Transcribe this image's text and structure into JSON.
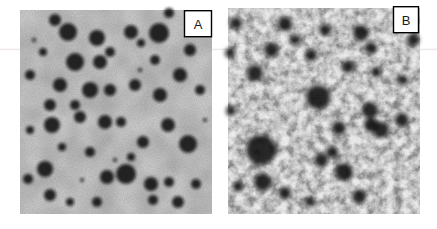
{
  "figure": {
    "panels": [
      {
        "label": "A",
        "droplets": [
          [
            35,
            10,
            6
          ],
          [
            48,
            22,
            9
          ],
          [
            77,
            28,
            8
          ],
          [
            90,
            42,
            5
          ],
          [
            23,
            42,
            4
          ],
          [
            55,
            52,
            9
          ],
          [
            80,
            52,
            7
          ],
          [
            10,
            65,
            5
          ],
          [
            40,
            75,
            7
          ],
          [
            70,
            80,
            8
          ],
          [
            90,
            80,
            6
          ],
          [
            30,
            95,
            6
          ],
          [
            55,
            95,
            5
          ],
          [
            111,
            22,
            7
          ],
          [
            139,
            23,
            10
          ],
          [
            121,
            33,
            4
          ],
          [
            149,
            3,
            5
          ],
          [
            170,
            40,
            6
          ],
          [
            135,
            50,
            5
          ],
          [
            160,
            65,
            7
          ],
          [
            115,
            75,
            6
          ],
          [
            140,
            85,
            7
          ],
          [
            180,
            80,
            5
          ],
          [
            32,
            115,
            8
          ],
          [
            10,
            120,
            4
          ],
          [
            60,
            107,
            6
          ],
          [
            85,
            112,
            7
          ],
          [
            42,
            137,
            4
          ],
          [
            70,
            142,
            5
          ],
          [
            25,
            159,
            8
          ],
          [
            8,
            169,
            5
          ],
          [
            87,
            167,
            7
          ],
          [
            30,
            185,
            6
          ],
          [
            50,
            192,
            4
          ],
          [
            77,
            192,
            5
          ],
          [
            148,
            115,
            7
          ],
          [
            123,
            132,
            6
          ],
          [
            168,
            134,
            9
          ],
          [
            111,
            147,
            4
          ],
          [
            106,
            164,
            10
          ],
          [
            131,
            174,
            7
          ],
          [
            149,
            172,
            5
          ],
          [
            176,
            174,
            5
          ],
          [
            133,
            190,
            5
          ],
          [
            158,
            192,
            6
          ],
          [
            101,
            112,
            5
          ],
          [
            14,
            30,
            2
          ],
          [
            120,
            60,
            2
          ],
          [
            95,
            150,
            2
          ],
          [
            62,
            170,
            2
          ],
          [
            185,
            110,
            2
          ]
        ]
      },
      {
        "label": "B",
        "droplets": [
          [
            57,
            16,
            7
          ],
          [
            97,
            22,
            6
          ],
          [
            133,
            25,
            8
          ],
          [
            185,
            32,
            6
          ],
          [
            43,
            42,
            7
          ],
          [
            27,
            65,
            8
          ],
          [
            120,
            59,
            6
          ],
          [
            148,
            64,
            5
          ],
          [
            90,
            89,
            12
          ],
          [
            142,
            102,
            8
          ],
          [
            153,
            122,
            8
          ],
          [
            33,
            142,
            15
          ],
          [
            93,
            152,
            7
          ],
          [
            35,
            174,
            9
          ],
          [
            116,
            164,
            9
          ],
          [
            174,
            112,
            7
          ],
          [
            67,
            32,
            5
          ],
          [
            8,
            15,
            6
          ],
          [
            2,
            45,
            5
          ],
          [
            83,
            47,
            6
          ],
          [
            143,
            40,
            6
          ],
          [
            111,
            120,
            7
          ],
          [
            143,
            117,
            7
          ],
          [
            104,
            144,
            6
          ],
          [
            131,
            189,
            7
          ],
          [
            10,
            179,
            5
          ],
          [
            57,
            185,
            6
          ],
          [
            82,
            194,
            5
          ],
          [
            3,
            103,
            5
          ],
          [
            175,
            72,
            5
          ]
        ]
      }
    ]
  },
  "colors": {
    "page_background": "#ffffff",
    "panel_a_background": "#8f8f8f",
    "panel_b_background": "#e0e0e0",
    "droplet": "#0e0e0e",
    "label_box_background": "#ffffff",
    "label_box_border": "#000000",
    "artifact_line": "#eae3e0"
  }
}
